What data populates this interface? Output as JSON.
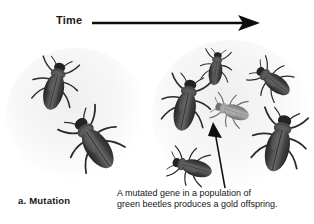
{
  "figure": {
    "timeline": {
      "label": "Time",
      "arrow_icon": "right-arrow-icon",
      "direction": "left-to-right"
    },
    "panel": {
      "letter_label": "a.  Mutation",
      "caption_line1": "A mutated gene in a population of",
      "caption_line2": "green beetles produces a gold offspring."
    },
    "annotation": {
      "pointer_icon": "callout-arrow-icon",
      "points_to": "gold-beetle"
    },
    "colors": {
      "background": "#ffffff",
      "ink": "#161616",
      "beetle_dark": "#3a3a3a",
      "beetle_gold": "#8e8e8e",
      "halo": "#b0b0b0"
    },
    "populations": [
      {
        "name": "ancestral-population",
        "group_id": "left",
        "beetle_count": 2,
        "beetles": [
          {
            "name": "beetle-dark-1",
            "morph": "green",
            "x": 30,
            "y": 58,
            "w": 50,
            "h": 56,
            "rot": 14,
            "scale": 1.0
          },
          {
            "name": "beetle-dark-2",
            "morph": "green",
            "x": 66,
            "y": 112,
            "w": 56,
            "h": 62,
            "rot": -34,
            "scale": 1.08
          }
        ]
      },
      {
        "name": "descendant-population",
        "group_id": "right",
        "beetle_count": 6,
        "beetles": [
          {
            "name": "beetle-dark-3",
            "morph": "green",
            "x": 196,
            "y": 46,
            "w": 40,
            "h": 45,
            "rot": 8,
            "scale": 0.86
          },
          {
            "name": "beetle-dark-4",
            "morph": "green",
            "x": 250,
            "y": 56,
            "w": 46,
            "h": 50,
            "rot": -52,
            "scale": 0.92
          },
          {
            "name": "beetle-dark-5",
            "morph": "green",
            "x": 160,
            "y": 76,
            "w": 52,
            "h": 58,
            "rot": 12,
            "scale": 1.04
          },
          {
            "name": "beetle-gold-1",
            "morph": "gold",
            "x": 210,
            "y": 88,
            "w": 44,
            "h": 46,
            "rot": -72,
            "scale": 0.88
          },
          {
            "name": "beetle-dark-6",
            "morph": "green",
            "x": 252,
            "y": 112,
            "w": 54,
            "h": 62,
            "rot": 14,
            "scale": 1.08
          },
          {
            "name": "beetle-dark-7",
            "morph": "green",
            "x": 168,
            "y": 142,
            "w": 48,
            "h": 50,
            "rot": -74,
            "scale": 0.94
          }
        ]
      }
    ]
  }
}
